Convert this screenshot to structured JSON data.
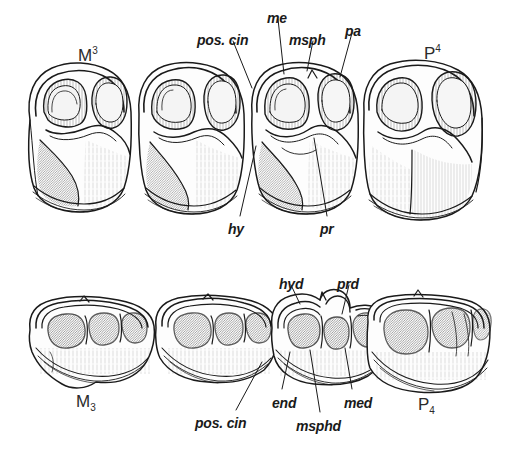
{
  "figure": {
    "kind": "scientific-illustration",
    "background_color": "#ffffff",
    "ink_color": "#1a1a1a",
    "width": 507,
    "height": 453
  },
  "upper_row": {
    "tooth_ids": [
      {
        "name": "upper-third-molar",
        "base": "M",
        "index": "3",
        "position": "superscript",
        "x": 78,
        "y": 46
      },
      {
        "name": "upper-fourth-premolar",
        "base": "P",
        "index": "4",
        "position": "superscript",
        "x": 424,
        "y": 44
      }
    ],
    "labels": [
      {
        "name": "pos-cin",
        "text": "pos. cin",
        "x": 197,
        "y": 33,
        "anchor": "start"
      },
      {
        "name": "me",
        "text": "me",
        "x": 267,
        "y": 11,
        "anchor": "start"
      },
      {
        "name": "msph",
        "text": "msph",
        "x": 289,
        "y": 33,
        "anchor": "start"
      },
      {
        "name": "pa",
        "text": "pa",
        "x": 345,
        "y": 24,
        "anchor": "start"
      },
      {
        "name": "hy",
        "text": "hy",
        "x": 228,
        "y": 222,
        "anchor": "start"
      },
      {
        "name": "pr",
        "text": "pr",
        "x": 320,
        "y": 222,
        "anchor": "start"
      }
    ]
  },
  "lower_row": {
    "tooth_ids": [
      {
        "name": "lower-third-molar",
        "base": "M",
        "index": "3",
        "position": "subscript",
        "x": 76,
        "y": 393
      },
      {
        "name": "lower-fourth-premolar",
        "base": "P",
        "index": "4",
        "position": "subscript",
        "x": 418,
        "y": 396
      }
    ],
    "labels": [
      {
        "name": "hyd",
        "text": "hyd",
        "x": 279,
        "y": 277,
        "anchor": "start"
      },
      {
        "name": "prd",
        "text": "prd",
        "x": 337,
        "y": 277,
        "anchor": "start"
      },
      {
        "name": "pos-cin-lower",
        "text": "pos. cin",
        "x": 195,
        "y": 416,
        "anchor": "start"
      },
      {
        "name": "end",
        "text": "end",
        "x": 272,
        "y": 396,
        "anchor": "start"
      },
      {
        "name": "msphd",
        "text": "msphd",
        "x": 296,
        "y": 419,
        "anchor": "start"
      },
      {
        "name": "med",
        "text": "med",
        "x": 344,
        "y": 396,
        "anchor": "start"
      }
    ]
  },
  "leader_lines": {
    "upper": [
      {
        "name": "leader-pos-cin",
        "x1": 233,
        "y1": 41,
        "x2": 252,
        "y2": 88
      },
      {
        "name": "leader-me",
        "x1": 278,
        "y1": 19,
        "x2": 284,
        "y2": 74
      },
      {
        "name": "leader-msph",
        "x1": 313,
        "y1": 41,
        "x2": 305,
        "y2": 71
      },
      {
        "name": "leader-pa",
        "x1": 352,
        "y1": 33,
        "x2": 340,
        "y2": 77
      },
      {
        "name": "leader-hy",
        "x1": 240,
        "y1": 216,
        "x2": 254,
        "y2": 145
      },
      {
        "name": "leader-pr",
        "x1": 327,
        "y1": 216,
        "x2": 314,
        "y2": 138
      }
    ],
    "lower": [
      {
        "name": "leader-hyd",
        "x1": 291,
        "y1": 285,
        "x2": 300,
        "y2": 305
      },
      {
        "name": "leader-prd",
        "x1": 349,
        "y1": 285,
        "x2": 342,
        "y2": 313
      },
      {
        "name": "leader-pos-cin-lower",
        "x1": 236,
        "y1": 410,
        "x2": 259,
        "y2": 365
      },
      {
        "name": "leader-end",
        "x1": 282,
        "y1": 389,
        "x2": 288,
        "y2": 352
      },
      {
        "name": "leader-msphd",
        "x1": 320,
        "y1": 412,
        "x2": 310,
        "y2": 350
      },
      {
        "name": "leader-med",
        "x1": 352,
        "y1": 389,
        "x2": 344,
        "y2": 348
      }
    ]
  },
  "upper_teeth": [
    {
      "name": "upper-tooth-1",
      "cx": 70,
      "cy": 140
    },
    {
      "name": "upper-tooth-2",
      "cx": 182,
      "cy": 140
    },
    {
      "name": "upper-tooth-3",
      "cx": 295,
      "cy": 140
    },
    {
      "name": "upper-tooth-4",
      "cx": 413,
      "cy": 140
    }
  ],
  "lower_teeth": [
    {
      "name": "lower-tooth-1",
      "cx": 95,
      "cy": 345
    },
    {
      "name": "lower-tooth-2",
      "cx": 198,
      "cy": 345
    },
    {
      "name": "lower-tooth-3",
      "cx": 295,
      "cy": 345
    },
    {
      "name": "lower-tooth-4",
      "cx": 405,
      "cy": 345
    }
  ]
}
